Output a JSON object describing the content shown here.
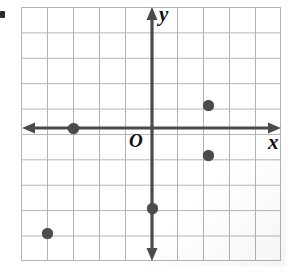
{
  "figure": {
    "axis_labels": {
      "x": "x",
      "y": "y",
      "origin": "O"
    },
    "colors": {
      "grid_line": "#b3b3b3",
      "axis": "#4b4b4b",
      "point": "#4b4b4b",
      "label": "#111111",
      "background": "#ffffff"
    }
  },
  "chart_data": {
    "type": "scatter",
    "title": "",
    "xlabel": "x",
    "ylabel": "y",
    "origin_label": "O",
    "grid": true,
    "grid_spacing": 1,
    "xlim": [
      -5,
      5
    ],
    "ylim": [
      -5,
      5
    ],
    "tick_labels_shown": false,
    "axis_arrows": [
      "left",
      "right",
      "up",
      "down"
    ],
    "points": [
      {
        "label": "A",
        "x": -3,
        "y": 0,
        "px": 73,
        "py": 128
      },
      {
        "label": "B",
        "x": 2,
        "y": 1,
        "px": 208,
        "py": 105
      },
      {
        "label": "C",
        "x": 2,
        "y": -1,
        "px": 208,
        "py": 155
      },
      {
        "label": "D",
        "x": 0,
        "y": -3,
        "px": 152,
        "py": 208
      },
      {
        "label": "E",
        "x": -4,
        "y": -4,
        "px": 47,
        "py": 233
      }
    ]
  }
}
